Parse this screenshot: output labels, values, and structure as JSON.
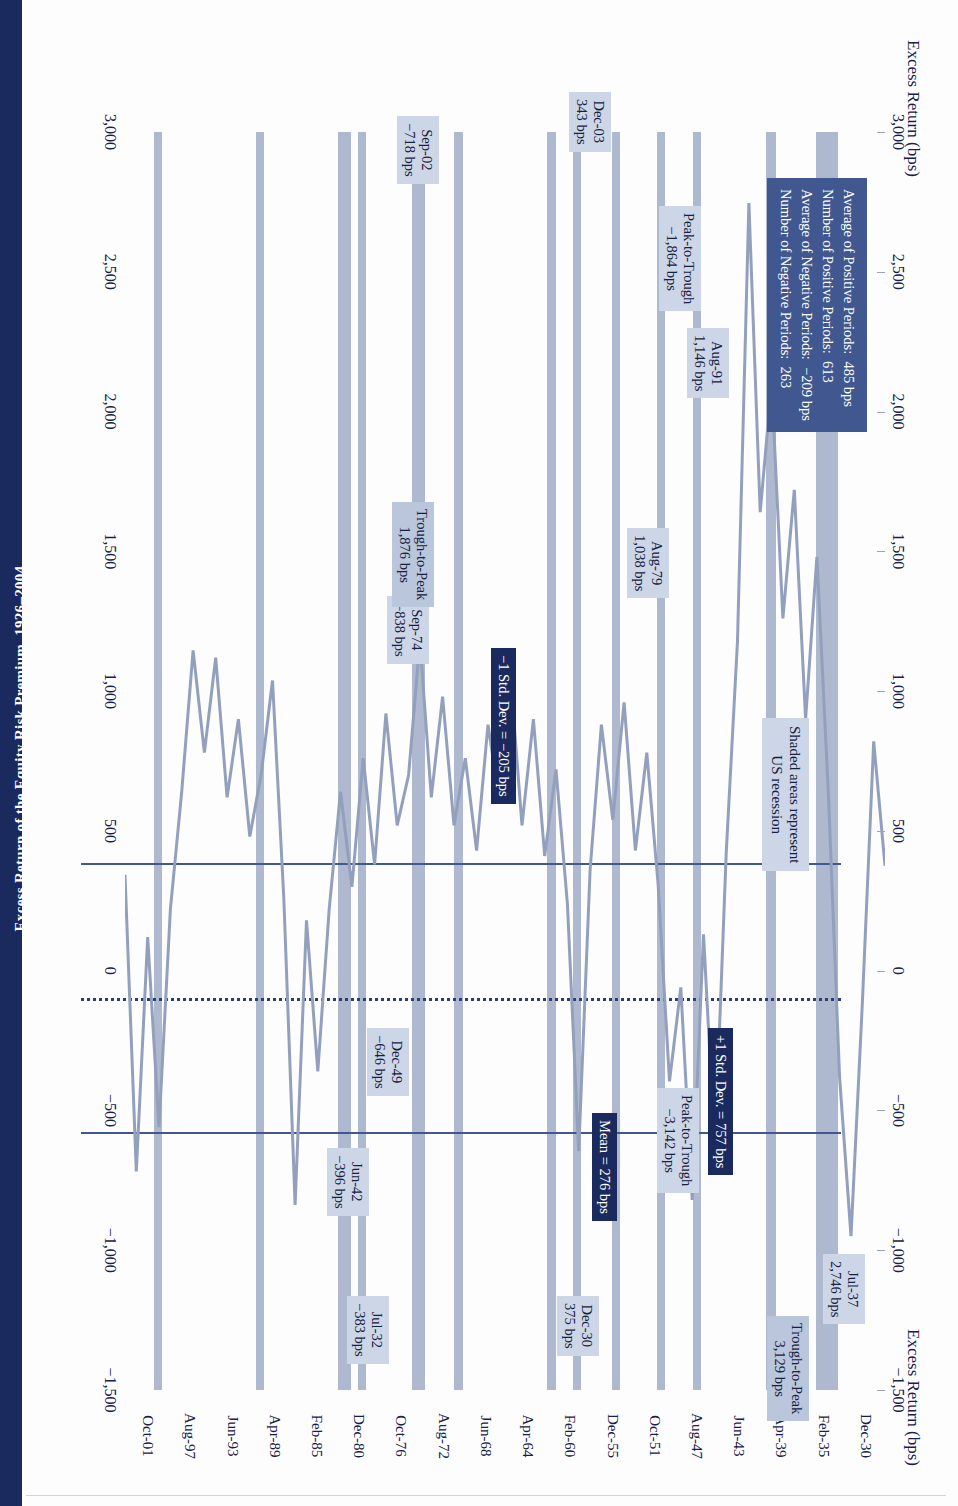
{
  "figure": {
    "title": "Excess Return of the Equity Risk Premium, 1926–2004",
    "axis_title_left": "Excess Return (bps)",
    "axis_title_right": "Excess Return (bps)",
    "recession_note": "Shaded areas represent\nUS recession"
  },
  "stats_box": {
    "lines": [
      "Average of Positive Periods:  485 bps",
      "Number of Positive Periods:  613",
      "Average of Negative Periods:  −209 bps",
      "Number of Negative Periods:  263"
    ]
  },
  "reference_lines": {
    "plus_one_sd": "+1 Std. Dev. = 757 bps",
    "mean": "Mean = 276 bps",
    "minus_one_sd": "−1 Std. Dev. = −205 bps"
  },
  "callouts": [
    {
      "name": "dec-30",
      "lines": "Dec-30\n375 bps"
    },
    {
      "name": "jul-37",
      "lines": "Jul-37\n2,746 bps"
    },
    {
      "name": "trough-to-peak-1930s",
      "lines": "Trough-to-Peak\n3,129 bps"
    },
    {
      "name": "jul-32",
      "lines": "Jul-32\n−383 bps"
    },
    {
      "name": "jun-42",
      "lines": "Jun-42\n−396 bps"
    },
    {
      "name": "peak-to-trough-1930s",
      "lines": "Peak-to-Trough\n−3,142 bps"
    },
    {
      "name": "dec-49",
      "lines": "Dec-49\n−646 bps"
    },
    {
      "name": "sep-74",
      "lines": "Sep-74\n−838 bps"
    },
    {
      "name": "aug-79",
      "lines": "Aug-79\n1,038 bps"
    },
    {
      "name": "trough-to-peak-1970s",
      "lines": "Trough-to-Peak\n1,876 bps"
    },
    {
      "name": "aug-91",
      "lines": "Aug-91\n1,146 bps"
    },
    {
      "name": "peak-to-trough-1990s",
      "lines": "Peak-to-Trough\n−1,864 bps"
    },
    {
      "name": "sep-02",
      "lines": "Sep-02\n−718 bps"
    },
    {
      "name": "dec-03",
      "lines": "Dec-03\n343 bps"
    }
  ],
  "chart_data": {
    "type": "line",
    "title": "Excess Return of the Equity Risk Premium, 1926–2004",
    "xlabel": "",
    "ylabel": "Excess Return (bps)",
    "ylim": [
      -1500,
      3000
    ],
    "ytick_labels": [
      "3,000",
      "2,500",
      "2,000",
      "1,500",
      "1,000",
      "500",
      "0",
      "−500",
      "−1,000",
      "−1,500"
    ],
    "ytick_values": [
      3000,
      2500,
      2000,
      1500,
      1000,
      500,
      0,
      -500,
      -1000,
      -1500
    ],
    "xtick_labels": [
      "Dec-30",
      "Feb-35",
      "Apr-39",
      "Jun-43",
      "Aug-47",
      "Oct-51",
      "Dec-55",
      "Feb-60",
      "Apr-64",
      "Jun-68",
      "Aug-72",
      "Oct-76",
      "Dec-80",
      "Feb-85",
      "Apr-89",
      "Jun-93",
      "Aug-97",
      "Oct-01"
    ],
    "grid": false,
    "legend_position": "none",
    "hlines": [
      {
        "label": "+1 Std. Dev. = 757 bps",
        "value": 757,
        "style": "solid",
        "color": "#41578f"
      },
      {
        "label": "Mean = 276 bps",
        "value": 276,
        "style": "dotted",
        "color": "#2b3d72"
      },
      {
        "label": "−1 Std. Dev. = −205 bps",
        "value": -205,
        "style": "solid",
        "color": "#41578f"
      }
    ],
    "annotated_points": [
      {
        "date": "Dec-30",
        "value": 375
      },
      {
        "date": "Jul-32",
        "value": -383
      },
      {
        "date": "Jul-37",
        "value": 2746
      },
      {
        "date": "Jun-42",
        "value": -396
      },
      {
        "date": "Dec-49",
        "value": -646
      },
      {
        "date": "Sep-74",
        "value": -838
      },
      {
        "date": "Aug-79",
        "value": 1038
      },
      {
        "date": "Aug-91",
        "value": 1146
      },
      {
        "date": "Sep-02",
        "value": -718
      },
      {
        "date": "Dec-03",
        "value": 343
      }
    ],
    "spans": [
      {
        "label": "Trough-to-Peak",
        "value": 3129,
        "from": "Jul-32",
        "to": "Jul-37"
      },
      {
        "label": "Peak-to-Trough",
        "value": -3142,
        "from": "Jul-37",
        "to": "Jun-42"
      },
      {
        "label": "Trough-to-Peak",
        "value": 1876,
        "from": "Sep-74",
        "to": "Aug-79"
      },
      {
        "label": "Peak-to-Trough",
        "value": -1864,
        "from": "Aug-91",
        "to": "Sep-02"
      }
    ],
    "statistics": {
      "average_positive_periods_bps": 485,
      "number_positive_periods": 613,
      "average_negative_periods_bps": -209,
      "number_negative_periods": 263,
      "mean_bps": 276,
      "plus_one_std_dev_bps": 757,
      "minus_one_std_dev_bps": -205
    },
    "recession_bands": [
      {
        "start": "Dec-30",
        "end": "Mar-33"
      },
      {
        "start": "May-37",
        "end": "Jun-38"
      },
      {
        "start": "Feb-45",
        "end": "Oct-45"
      },
      {
        "start": "Nov-48",
        "end": "Oct-49"
      },
      {
        "start": "Jul-53",
        "end": "May-54"
      },
      {
        "start": "Aug-57",
        "end": "Apr-58"
      },
      {
        "start": "Apr-60",
        "end": "Feb-61"
      },
      {
        "start": "Dec-69",
        "end": "Nov-70"
      },
      {
        "start": "Nov-73",
        "end": "Mar-75"
      },
      {
        "start": "Jan-80",
        "end": "Jul-80"
      },
      {
        "start": "Jul-81",
        "end": "Nov-82"
      },
      {
        "start": "Jul-90",
        "end": "Mar-91"
      },
      {
        "start": "Mar-01",
        "end": "Nov-01"
      }
    ],
    "series": [
      {
        "name": "Excess Return (bps)",
        "color": "#93a0bd",
        "values": [
          375,
          820,
          -120,
          -950,
          -383,
          640,
          1480,
          900,
          1720,
          1260,
          2100,
          1640,
          2746,
          1180,
          420,
          -640,
          130,
          -820,
          -60,
          -396,
          310,
          780,
          430,
          960,
          540,
          880,
          360,
          -646,
          240,
          720,
          410,
          900,
          520,
          1040,
          610,
          880,
          430,
          760,
          520,
          980,
          620,
          1180,
          700,
          520,
          920,
          380,
          760,
          300,
          640,
          220,
          -360,
          180,
          -838,
          260,
          1038,
          700,
          480,
          900,
          620,
          1120,
          780,
          1146,
          640,
          220,
          -560,
          120,
          -718,
          343
        ]
      }
    ]
  }
}
